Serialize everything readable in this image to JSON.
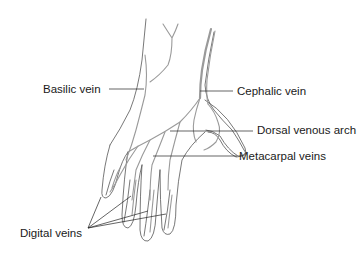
{
  "diagram": {
    "colors": {
      "outline": "#555555",
      "vein": "#9a9a9a",
      "leader": "#222222",
      "text": "#1a1a1a",
      "background": "#ffffff"
    },
    "labels": [
      {
        "id": "basilic",
        "text": "Basilic vein"
      },
      {
        "id": "cephalic",
        "text": "Cephalic vein"
      },
      {
        "id": "dorsal_arch",
        "text": "Dorsal venous arch"
      },
      {
        "id": "metacarpal",
        "text": "Metacarpal veins"
      },
      {
        "id": "digital",
        "text": "Digital veins"
      }
    ]
  }
}
